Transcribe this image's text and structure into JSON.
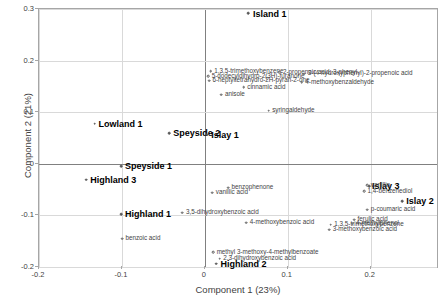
{
  "chart_data": {
    "type": "scatter",
    "title": "",
    "xlabel": "Component 1 (23%)",
    "ylabel": "Component 2 (21%)",
    "xlim": [
      -0.2,
      0.28
    ],
    "ylim": [
      -0.2,
      0.3
    ],
    "xticks": [
      "-0.2",
      "-0.1",
      "0",
      "0.1",
      "0.2"
    ],
    "xtick_values": [
      -0.2,
      -0.1,
      0,
      0.1,
      0.2
    ],
    "yticks": [
      "-0.2",
      "-0.1",
      "0",
      "0.1",
      "0.2",
      "0.3"
    ],
    "ytick_values": [
      -0.2,
      -0.1,
      0,
      0.1,
      0.2,
      0.3
    ],
    "grid": true,
    "legend": "none",
    "groups": [
      {
        "name": "regions",
        "points": [
          {
            "label": "Island 1",
            "x": 0.052,
            "y": 0.292,
            "label_dx": 5,
            "label_dy": -3.5
          },
          {
            "label": "Lowland 1",
            "x": -0.133,
            "y": 0.078,
            "label_dx": 4,
            "label_dy": -4
          },
          {
            "label": "Speyside 2",
            "x": -0.043,
            "y": 0.059,
            "label_dx": 4,
            "label_dy": -4
          },
          {
            "label": "Islay 1",
            "x": 0.003,
            "y": 0.056,
            "label_dx": 4,
            "label_dy": -4
          },
          {
            "label": "Speyside 1",
            "x": -0.101,
            "y": -0.005,
            "label_dx": 4,
            "label_dy": -4
          },
          {
            "label": "Highland 3",
            "x": -0.143,
            "y": -0.031,
            "label_dx": 4,
            "label_dy": -4
          },
          {
            "label": "Islay 3",
            "x": 0.198,
            "y": -0.043,
            "label_dx": 3,
            "label_dy": -4
          },
          {
            "label": "Highland 1",
            "x": -0.101,
            "y": -0.098,
            "label_dx": 4,
            "label_dy": -4
          },
          {
            "label": "Islay 2",
            "x": 0.238,
            "y": -0.073,
            "label_dx": 4,
            "label_dy": -4
          },
          {
            "label": "Highland 2",
            "x": 0.014,
            "y": -0.194,
            "label_dx": 4,
            "label_dy": -4
          }
        ]
      },
      {
        "name": "compounds",
        "points": [
          {
            "label": "1,3,5-trimethoxybenzene",
            "x": 0.007,
            "y": 0.179,
            "label_dx": 3.5,
            "label_dy": -3.5
          },
          {
            "label": "2-propenoic acid, 3-phenyl-",
            "x": 0.09,
            "y": 0.177,
            "label_dx": 3.5,
            "label_dy": -3.5
          },
          {
            "label": "3-(4-hydroxyphenyl)-2-propenoic acid",
            "x": 0.12,
            "y": 0.175,
            "label_dx": 3.5,
            "label_dy": -3.5
          },
          {
            "label": "5-dodecyldihydro-2(3H)-furanone",
            "x": 0.004,
            "y": 0.17,
            "label_dx": 3.5,
            "label_dy": -3.5
          },
          {
            "label": "6-heptyltetrahydro-2H-pyran-2-one",
            "x": 0.005,
            "y": 0.161,
            "label_dx": 3.5,
            "label_dy": -3.5
          },
          {
            "label": "4-methoxybenzaldehyde",
            "x": 0.117,
            "y": 0.158,
            "label_dx": 3.5,
            "label_dy": -3.5
          },
          {
            "label": "cinnamic acid",
            "x": 0.047,
            "y": 0.148,
            "label_dx": 3.5,
            "label_dy": -3.5
          },
          {
            "label": "anisole",
            "x": 0.02,
            "y": 0.134,
            "label_dx": 3.5,
            "label_dy": -3.5
          },
          {
            "label": "syringaldehyde",
            "x": 0.077,
            "y": 0.103,
            "label_dx": 3.5,
            "label_dy": -3.5
          },
          {
            "label": "vanillin",
            "x": 0.196,
            "y": -0.042,
            "label_dx": 3.5,
            "label_dy": -3.5
          },
          {
            "label": "1,4-benzenediol",
            "x": 0.192,
            "y": -0.053,
            "label_dx": 3.5,
            "label_dy": -3.5
          },
          {
            "label": "benzophenone",
            "x": 0.028,
            "y": -0.046,
            "label_dx": 3.5,
            "label_dy": -3.5
          },
          {
            "label": "vanillic acid",
            "x": 0.009,
            "y": -0.056,
            "label_dx": 3.5,
            "label_dy": -3.5
          },
          {
            "label": "p-coumaric acid",
            "x": 0.196,
            "y": -0.089,
            "label_dx": 3.5,
            "label_dy": -3.5
          },
          {
            "label": "3,5-dihydroxybenzoic acid",
            "x": -0.027,
            "y": -0.095,
            "label_dx": 3.5,
            "label_dy": -3.5
          },
          {
            "label": "4-methoxybenzoic acid",
            "x": 0.05,
            "y": -0.114,
            "label_dx": 3.5,
            "label_dy": -3.5
          },
          {
            "label": "ferulic acid",
            "x": 0.18,
            "y": -0.108,
            "label_dx": 3.5,
            "label_dy": -3.5
          },
          {
            "label": "1,3,5-trimethoxybenzene",
            "x": 0.152,
            "y": -0.118,
            "label_dx": 3.5,
            "label_dy": -3.5
          },
          {
            "label": "4-methylphenol",
            "x": 0.178,
            "y": -0.116,
            "label_dx": 3.5,
            "label_dy": -3.5
          },
          {
            "label": "3-methoxybenzoic acid",
            "x": 0.15,
            "y": -0.128,
            "label_dx": 3.5,
            "label_dy": -3.5
          },
          {
            "label": "benzoic acid",
            "x": -0.1,
            "y": -0.145,
            "label_dx": 3.5,
            "label_dy": -3.5
          },
          {
            "label": "methyl 3-methoxy-4-methylbenzoate",
            "x": 0.01,
            "y": -0.171,
            "label_dx": 3.5,
            "label_dy": -3.5
          },
          {
            "label": "2,3-dihydroxybenzoic acid",
            "x": 0.018,
            "y": -0.184,
            "label_dx": 3.5,
            "label_dy": -3.5
          }
        ]
      }
    ]
  }
}
